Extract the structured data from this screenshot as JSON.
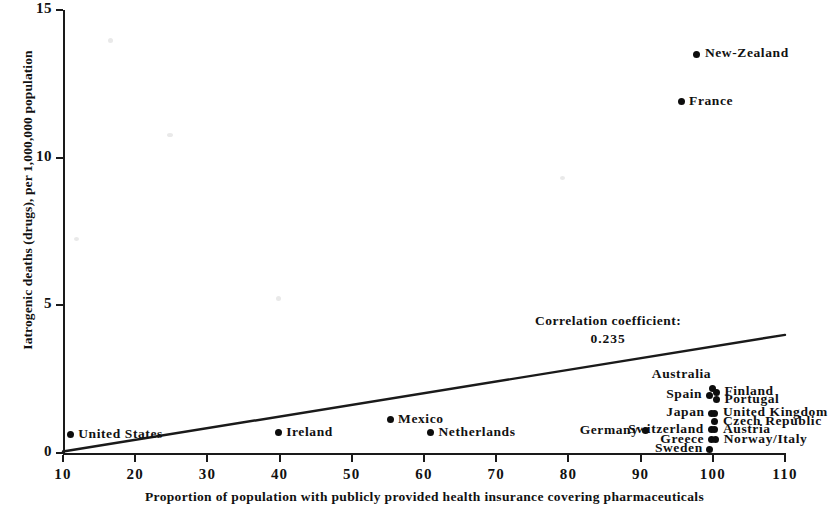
{
  "chart_data": {
    "type": "scatter",
    "title": "",
    "xlabel": "Proportion of population with publicly provided health insurance covering pharmaceuticals",
    "ylabel": "Iatrogenic deaths (drugs), per 1,000,000 population",
    "xlim": [
      10,
      110
    ],
    "ylim": [
      0,
      15
    ],
    "xticks": [
      10,
      20,
      30,
      40,
      50,
      60,
      70,
      80,
      90,
      100,
      110
    ],
    "yticks": [
      0,
      5,
      10,
      15
    ],
    "grid": false,
    "legend": null,
    "annotations": {
      "correlation_label": "Correlation coefficient:",
      "correlation_value": "0.235"
    },
    "trendline": {
      "x": [
        10,
        110
      ],
      "y": [
        0.05,
        4.0
      ]
    },
    "points": [
      {
        "label": "United States",
        "x": 11.0,
        "y": 0.62,
        "label_pos": "right"
      },
      {
        "label": "Ireland",
        "x": 39.8,
        "y": 0.68,
        "label_pos": "right"
      },
      {
        "label": "Mexico",
        "x": 55.3,
        "y": 1.12,
        "label_pos": "right"
      },
      {
        "label": "Netherlands",
        "x": 60.9,
        "y": 0.68,
        "label_pos": "right"
      },
      {
        "label": "France",
        "x": 95.6,
        "y": 11.9,
        "label_pos": "right"
      },
      {
        "label": "New-Zealand",
        "x": 97.8,
        "y": 13.5,
        "label_pos": "right"
      },
      {
        "label": "Germany",
        "x": 90.7,
        "y": 0.75,
        "label_pos": "left"
      },
      {
        "label": "Australia",
        "x": 100.0,
        "y": 2.2,
        "label_pos": "upleft"
      },
      {
        "label": "Spain",
        "x": 99.5,
        "y": 1.95,
        "label_pos": "left"
      },
      {
        "label": "Finland",
        "x": 100.5,
        "y": 2.05,
        "label_pos": "right"
      },
      {
        "label": "Portugal",
        "x": 100.5,
        "y": 1.8,
        "label_pos": "right"
      },
      {
        "label": "Japan",
        "x": 99.8,
        "y": 1.35,
        "label_pos": "left"
      },
      {
        "label": "United Kingdom",
        "x": 100.3,
        "y": 1.35,
        "label_pos": "right"
      },
      {
        "label": "Czech Republic",
        "x": 100.3,
        "y": 1.05,
        "label_pos": "right"
      },
      {
        "label": "Switzerland",
        "x": 99.8,
        "y": 0.78,
        "label_pos": "left"
      },
      {
        "label": "Austria",
        "x": 100.3,
        "y": 0.78,
        "label_pos": "right"
      },
      {
        "label": "Greece",
        "x": 99.8,
        "y": 0.45,
        "label_pos": "left"
      },
      {
        "label": "Norway/Italy",
        "x": 100.4,
        "y": 0.45,
        "label_pos": "right"
      },
      {
        "label": "Sweden",
        "x": 99.6,
        "y": 0.12,
        "label_pos": "left"
      }
    ]
  },
  "axes": {
    "y_tick_labels": [
      "15",
      "10",
      "5",
      "0"
    ],
    "x_tick_labels": [
      "10",
      "20",
      "30",
      "40",
      "50",
      "60",
      "70",
      "80",
      "90",
      "100",
      "110"
    ],
    "y_title": "Iatrogenic deaths (drugs), per 1,000,000 population",
    "x_title": "Proportion of population with publicly provided health insurance covering pharmaceuticals"
  },
  "colors": {
    "ink": "#111111",
    "point": "#0d0d0d",
    "background": "#ffffff"
  }
}
